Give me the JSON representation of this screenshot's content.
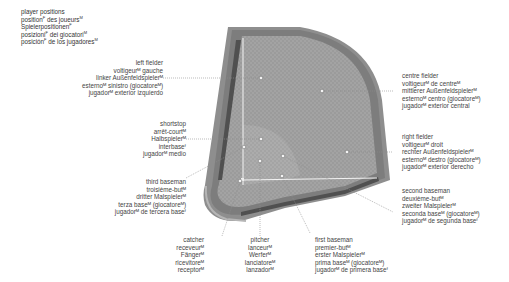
{
  "title": {
    "lines": [
      {
        "text": "player positions",
        "sup": ""
      },
      {
        "text": "position",
        "sup": "F",
        "rest": " des joueurs",
        "sup2": "M"
      },
      {
        "text": "Spielerpositionen",
        "sup": "F"
      },
      {
        "text": "posizioni",
        "sup": "F",
        "rest": " dei giocatori",
        "sup2": "M"
      },
      {
        "text": "posición",
        "sup": "F",
        "rest": " de los jugadores",
        "sup2": "M"
      }
    ]
  },
  "positions": {
    "left_fielder": {
      "en": "left fielder",
      "fr": "voltigeurᴹ gauche",
      "de": "linker Außenfeldspielerᴹ",
      "it": "esternoᴹ sinistro (giocatoreᴹ)",
      "es": "jugadorᴹ exterior izquierdo"
    },
    "centre_fielder": {
      "en": "centre fielder",
      "fr": "voltigeurᴹ de centreᴹ",
      "de": "mittlerer Außenfeldspielerᴹ",
      "it": "esternoᴹ centro (giocatoreᴹ)",
      "es": "jugadorᴹ exterior central"
    },
    "right_fielder": {
      "en": "right fielder",
      "fr": "voltigeurᴹ droit",
      "de": "rechter Außenfeldspielerᴹ",
      "it": "esternoᴹ destro (giocatoreᴹ)",
      "es": "jugadorᴹ exterior derecho"
    },
    "shortstop": {
      "en": "shortstop",
      "fr": "arrêt-courtᴹ",
      "de": "Halbspielerᴹ",
      "it": "interbaseᶠ",
      "es": "jugadorᴹ medio"
    },
    "third_baseman": {
      "en": "third baseman",
      "fr": "troisième-butᴹ",
      "de": "dritter Malspielerᴹ",
      "it": "terza baseᴹ (giocatoreᴹ)",
      "es": "jugadorᴹ de tercera baseᶠ"
    },
    "second_baseman": {
      "en": "second baseman",
      "fr": "deuxième-butᴹ",
      "de": "zweiter Malspielerᴹ",
      "it": "seconda baseᴹ (giocatoreᴹ)",
      "es": "jugadorᴹ de segunda baseᶠ"
    },
    "catcher": {
      "en": "catcher",
      "fr": "receveurᴹ",
      "de": "Fängerᴹ",
      "it": "ricevitoreᴹ",
      "es": "receptorᴹ"
    },
    "pitcher": {
      "en": "pitcher",
      "fr": "lanceurᴹ",
      "de": "Werferᴹ",
      "it": "lanciatoreᴹ",
      "es": "lanzadorᴹ"
    },
    "first_baseman": {
      "en": "first baseman",
      "fr": "premier-butᴹ",
      "de": "erster Malspielerᴹ",
      "it": "prima baseᴹ (giocatoreᴹ)",
      "es": "jugadorᴹ de primera baseᶠ"
    }
  },
  "colors": {
    "field_outer": "#8c8c8c",
    "field_inner": "#9a9a9a",
    "infield": "#a6a6a6",
    "wall_dark": "#505050",
    "foul_line": "#f0f0f0",
    "leader_line": "#9a9a9a",
    "text": "#3a3a3a"
  }
}
